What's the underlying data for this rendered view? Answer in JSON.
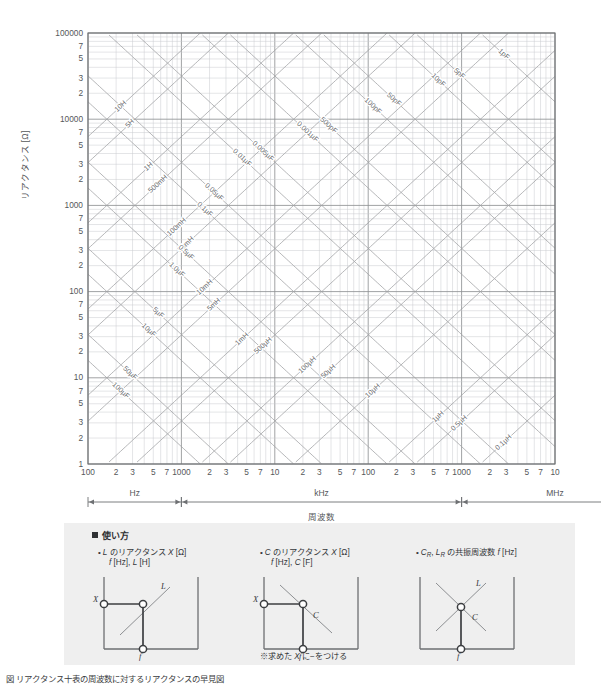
{
  "chart_data": {
    "type": "line",
    "title": "",
    "xlabel": "周波数",
    "ylabel": "リアクタンス [Ω]",
    "grid": true,
    "log_log": true,
    "x_decades": 5,
    "y_decades": 5,
    "xlim": [
      100,
      10000000
    ],
    "ylim": [
      1,
      100000
    ],
    "y_tick_labels": [
      "100000",
      "7",
      "5",
      "3",
      "2",
      "10000",
      "7",
      "5",
      "3",
      "2",
      "1000",
      "7",
      "5",
      "3",
      "2",
      "100",
      "7",
      "5",
      "3",
      "2",
      "10",
      "7",
      "5",
      "3",
      "2",
      "1"
    ],
    "x_tick_labels": [
      "100",
      "2",
      "3",
      "5",
      "7",
      "1000",
      "2",
      "3",
      "5",
      "7",
      "10",
      "2",
      "3",
      "5",
      "7",
      "100",
      "2",
      "3",
      "5",
      "7",
      "1000",
      "2",
      "3",
      "5",
      "7",
      "10",
      "2",
      "3",
      "5",
      "7",
      "100"
    ],
    "x_unit_brackets": [
      {
        "label": "Hz",
        "decades": 1
      },
      {
        "label": "kHz",
        "decades": 3
      },
      {
        "label": "MHz",
        "decades": 2
      }
    ],
    "inductance_lines": {
      "note": "X = 2*pi*f*L ; lines rising to the right",
      "labels": [
        "10H",
        "5H",
        "1H",
        "500mH",
        "100mH",
        "50mH",
        "10mH",
        "5mH",
        "1mH",
        "500µH",
        "100µH",
        "50µH",
        "10µH",
        "1µH",
        "0.5µH",
        "0.1µH"
      ],
      "values_henry": [
        10,
        5,
        1,
        0.5,
        0.1,
        0.05,
        0.01,
        0.005,
        0.001,
        0.0005,
        0.0001,
        5e-05,
        1e-05,
        1e-06,
        5e-07,
        1e-07
      ]
    },
    "capacitance_lines": {
      "note": "X = 1/(2*pi*f*C) ; lines falling to the right",
      "labels": [
        "1pF",
        "5pF",
        "10pF",
        "50pF",
        "100pF",
        "500pF",
        "0.001µF",
        "0.005µF",
        "0.01µF",
        "0.05µF",
        "0.1µF",
        "0.5µF",
        "1.0µF",
        "5µF",
        "10µF",
        "50µF",
        "100µF"
      ],
      "values_farad": [
        1e-12,
        5e-12,
        1e-11,
        5e-11,
        1e-10,
        5e-10,
        1e-09,
        5e-09,
        1e-08,
        5e-08,
        1e-07,
        5e-07,
        1e-06,
        5e-06,
        1e-05,
        5e-05,
        0.0001
      ]
    }
  },
  "axes": {
    "y_title": "リアクタンス [Ω]",
    "x_title": "周波数"
  },
  "usage": {
    "heading": "使い方",
    "items": [
      {
        "line1": "L のリアクタンス X [Ω]",
        "line2": "f [Hz], L [H]",
        "figure": "L-reactance-diagram"
      },
      {
        "line1": "C のリアクタンス X [Ω]",
        "line2": "f [Hz], C [F]",
        "figure": "C-reactance-diagram"
      },
      {
        "line1": "CR, LR の共振周波数 f [Hz]",
        "line2": "",
        "figure": "resonance-diagram"
      }
    ],
    "note": "※求めた X に−をつける",
    "figure_axis_labels": {
      "x": "X",
      "f": "f",
      "l": "L",
      "c": "C"
    }
  },
  "caption": "図 リアクタンス十表の周波数に対するリアクタンスの早見図"
}
